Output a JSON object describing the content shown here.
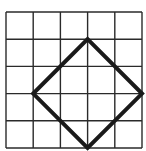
{
  "figure": {
    "background_color": "#ffffff",
    "grid": {
      "rows": 5,
      "cols": 5,
      "origin_x": 6,
      "origin_y": 12,
      "cell_size": 27.2,
      "line_color": "#2a2a2a",
      "line_width": 1.4
    },
    "shape": {
      "type": "square",
      "stroke_color": "#1a1a1a",
      "stroke_width": 4,
      "vertices_grid": [
        [
          3,
          1
        ],
        [
          5,
          3
        ],
        [
          3,
          5
        ],
        [
          1,
          3
        ]
      ]
    }
  }
}
